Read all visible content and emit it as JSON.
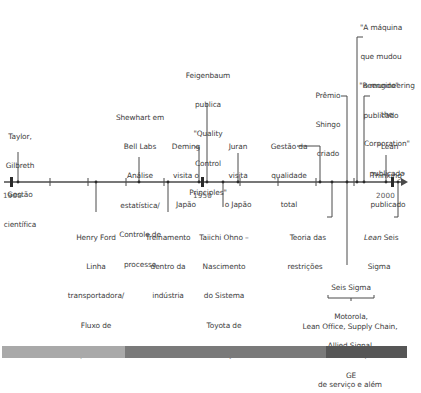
{
  "timeline": {
    "axis": {
      "start_year": 1900,
      "end_year": 2004,
      "labeled_years": [
        "1900",
        "1950",
        "2000"
      ]
    },
    "events_above": [
      {
        "id": "taylor",
        "lines": [
          "Taylor,",
          "Gilbreth",
          "Gestão",
          "científica"
        ]
      },
      {
        "id": "shewhart",
        "lines": [
          "Shewhart em",
          "Bell Labs",
          "Análise",
          "estatística/",
          "Controle de",
          "processo"
        ]
      },
      {
        "id": "deming",
        "lines": [
          "Deming",
          "visita o",
          "Japão"
        ]
      },
      {
        "id": "feigenbaum",
        "lines": [
          "Feigenbaum",
          "publica",
          "\"Quality",
          "Control",
          "Principles\""
        ]
      },
      {
        "id": "juran",
        "lines": [
          "Juran",
          "visita",
          "o Japão"
        ]
      },
      {
        "id": "tqm",
        "lines": [
          "Gestão da",
          "qualidade",
          "total"
        ]
      },
      {
        "id": "shingo",
        "lines": [
          "Prêmio",
          "Shingo",
          "criado"
        ]
      },
      {
        "id": "machine",
        "lines": [
          "\"A máquina",
          "que mudou",
          "o mundo\"",
          "publicado"
        ]
      },
      {
        "id": "reengineering",
        "lines": [
          "\"Reengineering",
          "the",
          "Corporation\"",
          "publicado"
        ]
      },
      {
        "id": "lean_thinking",
        "lines": [
          "\"Lean",
          "Thinking\"",
          "publicado"
        ]
      }
    ],
    "events_below": [
      {
        "id": "ford",
        "lines": [
          "Henry Ford",
          "Linha",
          "transportadora/",
          "Fluxo de",
          "processo"
        ]
      },
      {
        "id": "twi",
        "lines": [
          "Treinamento",
          "dentro da",
          "indústria"
        ]
      },
      {
        "id": "ohno",
        "lines": [
          "Taiichi Ohno –",
          "Nascimento",
          "do Sistema",
          "Toyota de",
          "Produção"
        ]
      },
      {
        "id": "toc",
        "lines": [
          "Teoria das",
          "restrições"
        ]
      },
      {
        "id": "lean_six_sigma",
        "italic_word": "Lean",
        "rest_line1": " Seis",
        "line2": "Sigma"
      },
      {
        "id": "six_sigma",
        "lines": [
          "Seis Sigma",
          "Motorola,",
          "Allied Signal,",
          "GE"
        ]
      },
      {
        "id": "lean_expansion",
        "lines": [
          "Lean Office, Supply Chain,",
          "Cuidados de saúde, indústrias",
          "de serviço e além"
        ]
      }
    ]
  },
  "bottom_bar": {
    "segments": [
      {
        "color": "#a9a9a9"
      },
      {
        "color": "#7a7a7a"
      },
      {
        "color": "#565656"
      }
    ]
  },
  "colors": {
    "line": "#4a4a4a",
    "text": "#3d3d3d"
  }
}
